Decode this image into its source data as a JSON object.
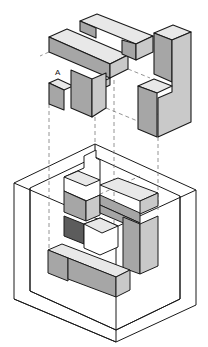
{
  "diagram": {
    "title": "",
    "labels": [
      {
        "id": "piece-a-label",
        "text": "A",
        "x": 55,
        "y": 68
      }
    ],
    "colors": {
      "outline": "#1a1a1a",
      "top": "#e8e8e8",
      "left": "#a6a6a6",
      "right": "#c9c9c9",
      "dark": "#5c5c5c",
      "white": "#ffffff",
      "guide": "#7a7a7a"
    },
    "pieces": [
      {
        "name": "upper-left-t-piece",
        "polys": [
          {
            "f": "top",
            "p": "49,37 67,29 128,55 110,64"
          },
          {
            "f": "left",
            "p": "49,37 110,64 110,78 49,52"
          },
          {
            "f": "right",
            "p": "110,64 128,55 128,69 110,78"
          },
          {
            "f": "top",
            "p": "49,83 58,79 73,86 64,90"
          },
          {
            "f": "left",
            "p": "49,83 64,90 64,110 49,104"
          },
          {
            "f": "left",
            "p": "71,70 92,79 92,117 71,108"
          },
          {
            "f": "right",
            "p": "92,79 106,73 106,87 110,85 110,78 106,80 106,108 92,117"
          }
        ]
      },
      {
        "name": "upper-back-bar",
        "polys": [
          {
            "f": "top",
            "p": "80,21 97,14 153,36 136,44"
          },
          {
            "f": "left",
            "p": "80,21 96,28 96,38 80,31"
          },
          {
            "f": "left",
            "p": "122,40 136,44 136,60 122,54"
          },
          {
            "f": "right",
            "p": "136,44 153,36 153,52 136,60"
          }
        ]
      },
      {
        "name": "upper-right-l-piece",
        "polys": [
          {
            "f": "top",
            "p": "154,33 173,25 191,32 172,40"
          },
          {
            "f": "left",
            "p": "154,33 172,40 172,82 154,74"
          },
          {
            "f": "right",
            "p": "172,40 191,32 191,122 158,137 158,98 172,92"
          },
          {
            "f": "top",
            "p": "138,86 154,79 172,86 157,93"
          },
          {
            "f": "left",
            "p": "138,86 157,93 157,137 138,129"
          }
        ]
      }
    ],
    "frame": {
      "outer": "14,183 14,299 116,342 196,305 196,190 95,144",
      "inner": "30,188 30,291 116,330 180,299 180,196 95,157",
      "outer_lines": [
        "14,183 116,227 196,190",
        "116,227 116,342",
        "30,188 30,291",
        "180,196 180,299",
        "30,291 116,330 180,299",
        "14,299 116,342",
        "95,144 95,157"
      ]
    },
    "lower_blocks": {
      "polys": [
        {
          "f": "white",
          "p": "84,156 96,150 96,158 100,160 100,195 87,201 64,191 64,177 84,168"
        },
        {
          "f": "top",
          "p": "64,177 78,171 100,180 86,186"
        },
        {
          "f": "left",
          "p": "64,191 86,201 86,221 64,212"
        },
        {
          "f": "right",
          "p": "86,201 100,195 100,215 86,221"
        },
        {
          "f": "top",
          "p": "100,185 118,178 158,193 140,201"
        },
        {
          "f": "left",
          "p": "100,195 140,213 140,223 100,205"
        },
        {
          "f": "right",
          "p": "140,201 158,193 158,206 140,214"
        },
        {
          "f": "left",
          "p": "100,205 140,223 140,230 100,213"
        },
        {
          "f": "left",
          "p": "123,217 140,224 140,274 129,270 123,268"
        },
        {
          "f": "right",
          "p": "140,224 158,216 158,266 140,274"
        },
        {
          "f": "dark",
          "p": "64,216 84,224 84,244 64,236"
        },
        {
          "f": "white",
          "p": "84,224 100,218 118,226 118,247 100,255 84,248"
        },
        {
          "f": "top",
          "p": "84,224 100,218 118,226 102,233"
        },
        {
          "f": "top",
          "p": "48,250 62,244 130,270 116,277"
        },
        {
          "f": "left",
          "p": "48,250 68,258 68,281 48,273"
        },
        {
          "f": "left",
          "p": "68,258 116,277 116,297 68,279"
        },
        {
          "f": "right",
          "p": "116,277 130,270 130,290 116,297"
        }
      ]
    },
    "guides": [
      "49,104 49,270",
      "95,117 95,180",
      "114,80 114,225",
      "158,137 158,210",
      "49,52 40,56",
      "128,69 150,78",
      "106,108 140,122 158,114",
      "74,206 140,176"
    ]
  }
}
